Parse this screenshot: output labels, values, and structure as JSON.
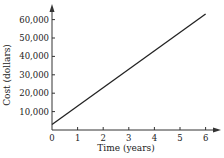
{
  "chart_data": {
    "type": "line",
    "title": "",
    "xlabel": "Time (years)",
    "ylabel": "Cost (dollars)",
    "x_ticks": [
      "0",
      "1",
      "2",
      "3",
      "4",
      "5",
      "6"
    ],
    "y_ticks": [
      "10,000",
      "20,000",
      "30,000",
      "40,000",
      "50,000",
      "60,000"
    ],
    "xlim": [
      0,
      6.3
    ],
    "ylim": [
      0,
      66000
    ],
    "grid": false,
    "series": [
      {
        "name": "Cost",
        "x": [
          0,
          6
        ],
        "y": [
          3000,
          63000
        ]
      }
    ]
  },
  "colors": {
    "line": "#222222",
    "axis": "#333333"
  }
}
